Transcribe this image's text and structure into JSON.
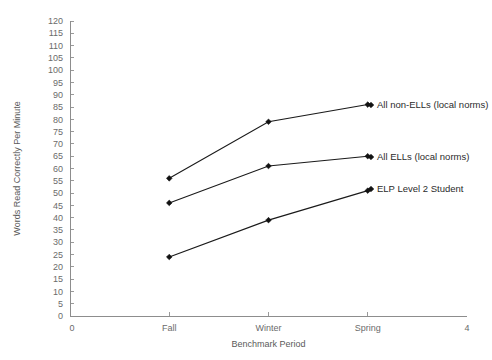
{
  "chart_data": {
    "type": "line",
    "title": "",
    "xlabel": "Benchmark Period",
    "ylabel": "Words Read Correctly Per Minute",
    "categories": [
      "Fall",
      "Winter",
      "Spring"
    ],
    "x_axis_endpoints": [
      "0",
      "4"
    ],
    "xlim": [
      0,
      4
    ],
    "x_category_positions": [
      1,
      2,
      3
    ],
    "ylim": [
      0,
      120
    ],
    "ytick_step": 5,
    "yticks": [
      0,
      5,
      10,
      15,
      20,
      25,
      30,
      35,
      40,
      45,
      50,
      55,
      60,
      65,
      70,
      75,
      80,
      85,
      90,
      95,
      100,
      105,
      110,
      115,
      120
    ],
    "ytick_labels": [
      "0",
      "5",
      "10",
      "15",
      "20",
      "25",
      "30",
      "35",
      "40",
      "45",
      "50",
      "55",
      "60",
      "65",
      "70",
      "75",
      "80",
      "85",
      "90",
      "95",
      "100",
      "105",
      "110",
      "115",
      "120"
    ],
    "grid": false,
    "legend_position": "inline-right-labels",
    "marker": "filled-diamond",
    "line_color": "#111111",
    "series": [
      {
        "name": "All non-ELLs (local norms)",
        "values": [
          56,
          79,
          86
        ]
      },
      {
        "name": "All ELLs (local norms)",
        "values": [
          46,
          61,
          65
        ]
      },
      {
        "name": "ELP Level 2 Student",
        "values": [
          24,
          39,
          51
        ]
      }
    ]
  },
  "labels": {
    "series_0": "All non-ELLs (local norms)",
    "series_1": "All ELLs (local norms)",
    "series_2": "ELP Level 2 Student"
  }
}
